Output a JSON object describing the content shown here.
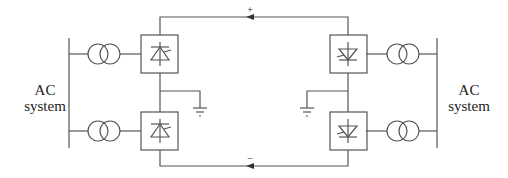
{
  "diagram": {
    "left_system": {
      "line1": "AC",
      "line2": "system"
    },
    "right_system": {
      "line1": "AC",
      "line2": "system"
    },
    "positive_pole": "+",
    "negative_pole": "−",
    "components": {
      "transformers": 4,
      "converters": 4,
      "grounds": 2
    },
    "colors": {
      "line": "#555555",
      "text": "#222222",
      "background": "#ffffff"
    }
  }
}
